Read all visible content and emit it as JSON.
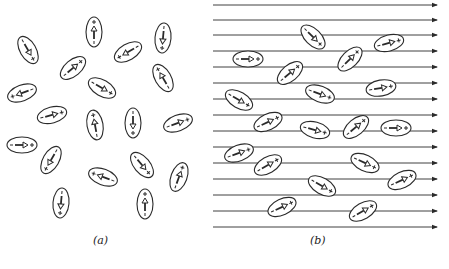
{
  "figure": {
    "panels": [
      {
        "label": "(a)",
        "description": "Randomly oriented dipoles, no external field",
        "dipoles": [
          {
            "x": 94,
            "y": 32,
            "angle": -90
          },
          {
            "x": 28,
            "y": 50,
            "angle": 60
          },
          {
            "x": 128,
            "y": 52,
            "angle": 150
          },
          {
            "x": 163,
            "y": 38,
            "angle": 95
          },
          {
            "x": 73,
            "y": 68,
            "angle": -40
          },
          {
            "x": 163,
            "y": 78,
            "angle": -120
          },
          {
            "x": 102,
            "y": 88,
            "angle": 30
          },
          {
            "x": 22,
            "y": 93,
            "angle": 160
          },
          {
            "x": 52,
            "y": 115,
            "angle": -15
          },
          {
            "x": 95,
            "y": 125,
            "angle": -100
          },
          {
            "x": 133,
            "y": 123,
            "angle": 90
          },
          {
            "x": 178,
            "y": 123,
            "angle": -20
          },
          {
            "x": 22,
            "y": 145,
            "angle": 0
          },
          {
            "x": 51,
            "y": 160,
            "angle": 120
          },
          {
            "x": 103,
            "y": 177,
            "angle": 200
          },
          {
            "x": 142,
            "y": 165,
            "angle": 50
          },
          {
            "x": 179,
            "y": 177,
            "angle": -70
          },
          {
            "x": 61,
            "y": 203,
            "angle": 95
          },
          {
            "x": 145,
            "y": 204,
            "angle": -90
          }
        ]
      },
      {
        "label": "(b)",
        "description": "Dipoles partially aligned with applied field",
        "field_lines_y": [
          5,
          20,
          35,
          51,
          67,
          83,
          99,
          115,
          131,
          147,
          163,
          179,
          195,
          211,
          227
        ],
        "field_x_start": 213,
        "field_x_end": 437,
        "dipoles": [
          {
            "x": 313,
            "y": 37,
            "angle": 45
          },
          {
            "x": 389,
            "y": 43,
            "angle": -15
          },
          {
            "x": 248,
            "y": 59,
            "angle": 0
          },
          {
            "x": 350,
            "y": 59,
            "angle": -45
          },
          {
            "x": 290,
            "y": 73,
            "angle": -40
          },
          {
            "x": 381,
            "y": 88,
            "angle": -10
          },
          {
            "x": 320,
            "y": 94,
            "angle": 20
          },
          {
            "x": 239,
            "y": 100,
            "angle": 30
          },
          {
            "x": 268,
            "y": 122,
            "angle": -25
          },
          {
            "x": 356,
            "y": 127,
            "angle": -40
          },
          {
            "x": 315,
            "y": 130,
            "angle": 15
          },
          {
            "x": 396,
            "y": 128,
            "angle": 0
          },
          {
            "x": 239,
            "y": 153,
            "angle": -20
          },
          {
            "x": 268,
            "y": 165,
            "angle": -30
          },
          {
            "x": 365,
            "y": 163,
            "angle": 25
          },
          {
            "x": 322,
            "y": 186,
            "angle": 30
          },
          {
            "x": 402,
            "y": 180,
            "angle": -25
          },
          {
            "x": 282,
            "y": 207,
            "angle": -25
          },
          {
            "x": 363,
            "y": 211,
            "angle": -30
          }
        ]
      }
    ],
    "labels": {
      "a": "(a)",
      "b": "(b)"
    },
    "colors": {
      "ink": "#2a2a2a",
      "paper": "#ffffff"
    }
  }
}
